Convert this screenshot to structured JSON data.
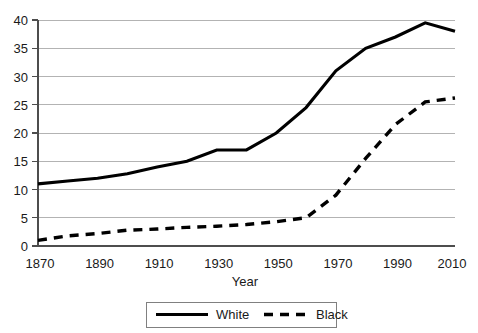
{
  "chart_data": {
    "type": "line",
    "title": "",
    "xlabel": "Year",
    "ylabel": "",
    "x": [
      1870,
      1880,
      1890,
      1900,
      1910,
      1920,
      1930,
      1940,
      1950,
      1960,
      1970,
      1980,
      1990,
      2000,
      2010
    ],
    "series": [
      {
        "name": "White",
        "style": "solid",
        "color": "#000000",
        "values": [
          11.0,
          11.5,
          12.0,
          12.8,
          14.0,
          15.0,
          17.0,
          17.0,
          20.0,
          24.5,
          31.0,
          35.0,
          37.0,
          39.5,
          38.0
        ]
      },
      {
        "name": "Black",
        "style": "dashed",
        "color": "#000000",
        "values": [
          1.0,
          1.8,
          2.2,
          2.8,
          3.0,
          3.3,
          3.5,
          3.8,
          4.3,
          5.0,
          9.0,
          15.5,
          21.5,
          25.5,
          26.2
        ]
      }
    ],
    "xlim": [
      1870,
      2010
    ],
    "ylim": [
      0,
      40
    ],
    "xticks": [
      "1870",
      "1890",
      "1910",
      "1930",
      "1950",
      "1970",
      "1990",
      "2010"
    ],
    "xtick_values": [
      1870,
      1890,
      1910,
      1930,
      1950,
      1970,
      1990,
      2010
    ],
    "yticks": [
      "0",
      "5",
      "10",
      "15",
      "20",
      "25",
      "30",
      "35",
      "40"
    ],
    "ytick_values": [
      0,
      5,
      10,
      15,
      20,
      25,
      30,
      35,
      40
    ],
    "grid": "horizontal",
    "legend_position": "bottom-center",
    "legend": [
      "White",
      "Black"
    ]
  },
  "axis": {
    "x_title": "Year"
  },
  "legend": {
    "entries": [
      {
        "label": "White"
      },
      {
        "label": "Black"
      }
    ]
  }
}
